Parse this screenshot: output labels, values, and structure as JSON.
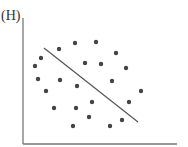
{
  "figure": {
    "panel_label": "(H)",
    "axis_color": "#777777",
    "dot_color": "#444444",
    "line_color": "#555555"
  },
  "chart_data": {
    "type": "scatter",
    "title": "(H)",
    "xlabel": "",
    "ylabel": "",
    "grid": false,
    "legend": null,
    "axes_px": {
      "origin": [
        23,
        144
      ],
      "x_end": 177,
      "y_top": 18
    },
    "points_px": [
      [
        59,
        49
      ],
      [
        75,
        43
      ],
      [
        96,
        42
      ],
      [
        41,
        58
      ],
      [
        35,
        66
      ],
      [
        85,
        63
      ],
      [
        101,
        64
      ],
      [
        116,
        53
      ],
      [
        126,
        68
      ],
      [
        38,
        79
      ],
      [
        60,
        80
      ],
      [
        77,
        86
      ],
      [
        112,
        81
      ],
      [
        141,
        91
      ],
      [
        46,
        91
      ],
      [
        92,
        102
      ],
      [
        129,
        102
      ],
      [
        54,
        108
      ],
      [
        76,
        108
      ],
      [
        89,
        117
      ],
      [
        122,
        120
      ],
      [
        73,
        126
      ],
      [
        110,
        126
      ]
    ],
    "trend_line_px": {
      "from": [
        44,
        48
      ],
      "to": [
        138,
        122
      ]
    },
    "annotation": "Scattered points with a downward-sloping straight line (no correlation pattern fits the line)"
  }
}
